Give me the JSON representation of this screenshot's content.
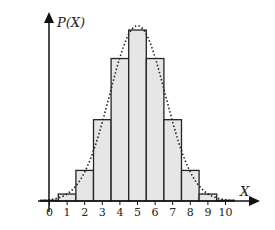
{
  "chart_data": {
    "type": "bar",
    "title": "",
    "xlabel": "X",
    "ylabel": "P(X)",
    "categories": [
      "0",
      "1",
      "2",
      "3",
      "4",
      "5",
      "6",
      "7",
      "8",
      "9",
      "10"
    ],
    "x": [
      0,
      1,
      2,
      3,
      4,
      5,
      6,
      7,
      8,
      9,
      10
    ],
    "values": [
      0.001,
      0.01,
      0.044,
      0.117,
      0.205,
      0.246,
      0.205,
      0.117,
      0.044,
      0.01,
      0.001
    ],
    "overlay": {
      "type": "line",
      "style": "dotted",
      "description": "normal approximation curve"
    },
    "ylim": [
      0,
      0.27
    ],
    "grid": false,
    "legend": null,
    "colors": {
      "bar_fill": "#e6e6e6",
      "bar_stroke": "#222222",
      "axis": "#111111",
      "curve": "#222222"
    }
  }
}
